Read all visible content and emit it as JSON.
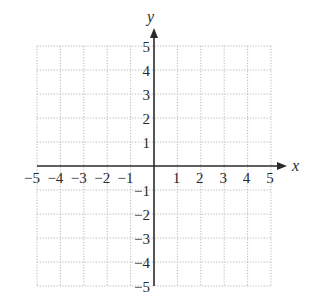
{
  "chart_data": {
    "type": "scatter",
    "title": "",
    "xlabel": "x",
    "ylabel": "y",
    "xlim": [
      -5,
      5
    ],
    "ylim": [
      -5,
      5
    ],
    "grid": true,
    "grid_style": "dotted",
    "x_ticks": [
      -5,
      -4,
      -3,
      -2,
      -1,
      1,
      2,
      3,
      4,
      5
    ],
    "y_ticks": [
      5,
      4,
      3,
      2,
      1,
      -1,
      -2,
      -3,
      -4,
      -5
    ],
    "x_tick_labels": [
      "−5",
      "−4",
      "−3",
      "−2",
      "−1",
      "1",
      "2",
      "3",
      "4",
      "5"
    ],
    "y_tick_labels": [
      "5",
      "4",
      "3",
      "2",
      "1",
      "−1",
      "−2",
      "−3",
      "−4",
      "−5"
    ],
    "series": [],
    "legend": null
  },
  "colors": {
    "axis": "#2a2a2a",
    "grid": "#b8b8b8",
    "background": "#ffffff"
  }
}
